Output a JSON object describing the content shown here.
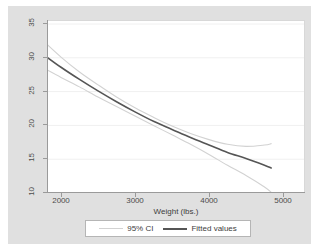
{
  "chart_data": {
    "type": "line",
    "title": "",
    "xlabel": "Weight (lbs.)",
    "ylabel": "",
    "xlim": [
      1760,
      4900
    ],
    "ylim": [
      10,
      35
    ],
    "xticks": [
      2000,
      3000,
      4000,
      5000
    ],
    "yticks": [
      10,
      15,
      20,
      25,
      30,
      35
    ],
    "grid": "horizontal",
    "legend_position": "bottom",
    "series": [
      {
        "name": "Fitted values",
        "color": "#555555",
        "x": [
          1760,
          2000,
          2250,
          2500,
          2750,
          3000,
          3250,
          3500,
          3750,
          4000,
          4250,
          4500,
          4750,
          4840
        ],
        "y": [
          30.5,
          28.6,
          26.8,
          25.1,
          23.5,
          22.0,
          20.6,
          19.4,
          18.2,
          17.1,
          16.0,
          15.1,
          14.1,
          13.7
        ]
      },
      {
        "name": "95% CI upper",
        "color": "#d2d2d2",
        "x": [
          1760,
          2000,
          2250,
          2500,
          2750,
          3000,
          3250,
          3500,
          3750,
          4000,
          4250,
          4500,
          4750,
          4840
        ],
        "y": [
          32.5,
          30.1,
          27.9,
          26.0,
          24.2,
          22.6,
          21.2,
          19.9,
          18.8,
          17.9,
          17.2,
          16.9,
          17.1,
          17.3
        ]
      },
      {
        "name": "95% CI lower",
        "color": "#d2d2d2",
        "x": [
          1760,
          2000,
          2250,
          2500,
          2750,
          3000,
          3250,
          3500,
          3750,
          4000,
          4250,
          4500,
          4750,
          4840
        ],
        "y": [
          28.5,
          27.1,
          25.7,
          24.2,
          22.8,
          21.4,
          20.0,
          18.6,
          17.2,
          15.7,
          14.1,
          12.6,
          10.9,
          10.1
        ]
      }
    ],
    "legend": [
      {
        "label": "95% CI",
        "color": "#d2d2d2",
        "style": "thin"
      },
      {
        "label": "Fitted values",
        "color": "#555555",
        "style": "thick"
      }
    ]
  },
  "axis": {
    "y_tick_labels": [
      "10",
      "15",
      "20",
      "25",
      "30",
      "35"
    ],
    "x_tick_labels": [
      "2000",
      "3000",
      "4000",
      "5000"
    ],
    "x_title": "Weight (lbs.)"
  },
  "colors": {
    "graph_background": "#e0e0e0",
    "plot_background": "#ffffff",
    "fitted_line": "#555555",
    "ci_line": "#d2d2d2",
    "axis": "#9a9a9a",
    "gridline": "#f0f0f0"
  }
}
